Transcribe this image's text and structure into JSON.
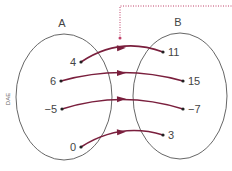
{
  "diagram": {
    "type": "mapping-diagram",
    "side_label": "DAE",
    "sets": [
      {
        "name": "A",
        "label": "A",
        "elements": [
          "4",
          "6",
          "−5",
          "0"
        ]
      },
      {
        "name": "B",
        "label": "B",
        "elements": [
          "11",
          "15",
          "−7",
          "3"
        ]
      }
    ],
    "mappings": [
      {
        "from": "4",
        "to": "11"
      },
      {
        "from": "6",
        "to": "15"
      },
      {
        "from": "−5",
        "to": "−7"
      },
      {
        "from": "0",
        "to": "3"
      }
    ],
    "colors": {
      "arrow": "#7a1f3d",
      "ellipse": "#555555",
      "dotted_leader": "#c0406a",
      "text": "#444444"
    }
  }
}
